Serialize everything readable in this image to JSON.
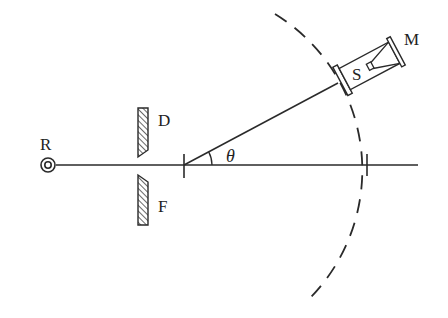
{
  "diagram": {
    "type": "physics-apparatus",
    "labels": {
      "source": "R",
      "upper_plate": "D",
      "lower_plate": "F",
      "angle": "θ",
      "detector": "S",
      "mirror": "M"
    },
    "colors": {
      "line": "#2a2a2a",
      "background": "#ffffff"
    },
    "geometry": {
      "axis_y": 165,
      "axis_x_start": 48,
      "axis_x_end": 418,
      "pivot": [
        184,
        165
      ],
      "arm_angle_deg": 28,
      "arc_radius": 183
    }
  }
}
